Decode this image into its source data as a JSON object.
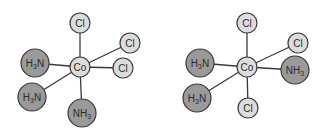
{
  "diagram": {
    "type": "coordination-complex-isomers",
    "colors": {
      "light_atom": "#dcdcdc",
      "dark_atom": "#9a9a9a",
      "bond": "#3a3a3a"
    },
    "molecules": [
      {
        "name": "fac-isomer",
        "center": {
          "label": "Co",
          "x": 80,
          "y": 67,
          "r": 10
        },
        "ligands": [
          {
            "label": "Cl",
            "sub": "",
            "prefix": "",
            "x": 80,
            "y": 23,
            "r": 10,
            "shade": "light"
          },
          {
            "label": "Cl",
            "sub": "",
            "prefix": "",
            "x": 130,
            "y": 43,
            "r": 10,
            "shade": "light"
          },
          {
            "label": "Cl",
            "sub": "",
            "prefix": "",
            "x": 123,
            "y": 68,
            "r": 10,
            "shade": "light"
          },
          {
            "label": "H",
            "sub": "3",
            "suffix": "N",
            "x": 35,
            "y": 63,
            "r": 14,
            "shade": "dark"
          },
          {
            "label": "H",
            "sub": "3",
            "suffix": "N",
            "x": 32,
            "y": 97,
            "r": 14,
            "shade": "dark"
          },
          {
            "label": "NH",
            "sub": "3",
            "suffix": "",
            "x": 82,
            "y": 113,
            "r": 14,
            "shade": "dark"
          }
        ]
      },
      {
        "name": "mer-isomer",
        "center": {
          "label": "Co",
          "x": 247,
          "y": 67,
          "r": 10
        },
        "ligands": [
          {
            "label": "Cl",
            "sub": "",
            "suffix": "",
            "x": 247,
            "y": 23,
            "r": 10,
            "shade": "light"
          },
          {
            "label": "Cl",
            "sub": "",
            "suffix": "",
            "x": 298,
            "y": 43,
            "r": 10,
            "shade": "light"
          },
          {
            "label": "NH",
            "sub": "3",
            "suffix": "",
            "x": 295,
            "y": 70,
            "r": 14,
            "shade": "dark"
          },
          {
            "label": "H",
            "sub": "3",
            "suffix": "N",
            "x": 200,
            "y": 63,
            "r": 14,
            "shade": "dark"
          },
          {
            "label": "H",
            "sub": "3",
            "suffix": "N",
            "x": 197,
            "y": 98,
            "r": 14,
            "shade": "dark"
          },
          {
            "label": "Cl",
            "sub": "",
            "suffix": "",
            "x": 248,
            "y": 108,
            "r": 10,
            "shade": "light"
          }
        ]
      }
    ]
  }
}
